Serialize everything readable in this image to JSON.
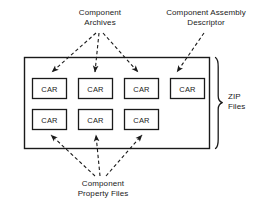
{
  "diagram": {
    "colors": {
      "stroke": "#1a1a1a",
      "background": "#ffffff",
      "text": "#1a1a1a"
    },
    "labels": {
      "component_archives": "Component\nArchives",
      "assembly_descriptor": "Component Assembly\nDescriptor",
      "property_files": "Component\nProperty Files",
      "zip_files": "ZIP\nFiles"
    },
    "container": {
      "name": "outer-container",
      "x": 24,
      "y": 57,
      "width": 185,
      "height": 91
    },
    "brace": {
      "name": "zip-files-brace",
      "orientation": "right",
      "x": 215,
      "y": 57,
      "height": 91
    },
    "boxes": {
      "label": "CAR",
      "row1": [
        {
          "id": "car-1",
          "x": 32,
          "y": 78,
          "width": 34,
          "height": 20
        },
        {
          "id": "car-2",
          "x": 78,
          "y": 78,
          "width": 34,
          "height": 20
        },
        {
          "id": "car-3",
          "x": 124,
          "y": 78,
          "width": 34,
          "height": 20
        },
        {
          "id": "car-4",
          "x": 170,
          "y": 78,
          "width": 34,
          "height": 20
        }
      ],
      "row2": [
        {
          "id": "car-5",
          "x": 32,
          "y": 109,
          "width": 34,
          "height": 20
        },
        {
          "id": "car-6",
          "x": 78,
          "y": 109,
          "width": 34,
          "height": 20
        },
        {
          "id": "car-7",
          "x": 124,
          "y": 109,
          "width": 34,
          "height": 20
        }
      ]
    },
    "arrows": {
      "style": "dashed",
      "from_component_archives": [
        {
          "id": "arrow-archives-to-car1",
          "x1": 96,
          "y1": 33,
          "x2": 52,
          "y2": 73
        },
        {
          "id": "arrow-archives-to-car2",
          "x1": 99,
          "y1": 33,
          "x2": 95,
          "y2": 73
        },
        {
          "id": "arrow-archives-to-car3",
          "x1": 103,
          "y1": 33,
          "x2": 138,
          "y2": 73
        }
      ],
      "from_assembly_descriptor": [
        {
          "id": "arrow-descriptor-to-car4",
          "x1": 203,
          "y1": 33,
          "x2": 177,
          "y2": 73
        }
      ],
      "from_property_files": [
        {
          "id": "arrow-properties-to-car5",
          "x1": 95,
          "y1": 176,
          "x2": 51,
          "y2": 134
        },
        {
          "id": "arrow-properties-to-car6",
          "x1": 100,
          "y1": 176,
          "x2": 96,
          "y2": 134
        },
        {
          "id": "arrow-properties-to-car7",
          "x1": 106,
          "y1": 176,
          "x2": 142,
          "y2": 134
        }
      ]
    }
  }
}
